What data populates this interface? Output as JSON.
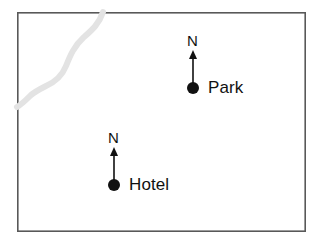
{
  "figure": {
    "type": "map",
    "width": 322,
    "height": 248,
    "background_color": "#ffffff"
  },
  "map_frame": {
    "name": "map-border",
    "x": 17,
    "y": 12,
    "width": 289,
    "height": 220,
    "stroke_color": "#595959",
    "stroke_width": 1.6,
    "fill_color": "#ffffff"
  },
  "river": {
    "name": "river",
    "color": "#e3e3e3",
    "stroke_width": 6,
    "path": "M 103 12 C 99 24, 92 30, 84 37 C 74 46, 70 56, 66 66 C 62 76, 55 82, 46 86 C 38 90, 34 92, 30 96 C 26 100, 22 104, 17 107"
  },
  "markers": [
    {
      "id": "park",
      "label": "Park",
      "dot": {
        "cx": 193,
        "cy": 88,
        "r": 6,
        "color": "#111111"
      },
      "arrow": {
        "x": 193,
        "y_start": 88,
        "y_end": 53,
        "color": "#111111",
        "stroke_width": 1.6,
        "head_width": 8,
        "head_height": 9
      },
      "north_label": "N",
      "label_color": "#111111"
    },
    {
      "id": "hotel",
      "label": "Hotel",
      "dot": {
        "cx": 114,
        "cy": 185,
        "r": 6,
        "color": "#111111"
      },
      "arrow": {
        "x": 114,
        "y_start": 185,
        "y_end": 150,
        "color": "#111111",
        "stroke_width": 1.6,
        "head_width": 8,
        "head_height": 9
      },
      "north_label": "N",
      "label_color": "#111111"
    }
  ]
}
